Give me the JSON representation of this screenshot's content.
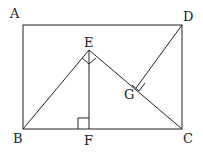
{
  "diagram": {
    "type": "geometry",
    "points": {
      "A": {
        "label": "A",
        "x": 23,
        "y": 25
      },
      "B": {
        "label": "B",
        "x": 23,
        "y": 129
      },
      "C": {
        "label": "C",
        "x": 182,
        "y": 129
      },
      "D": {
        "label": "D",
        "x": 182,
        "y": 25
      },
      "E": {
        "label": "E",
        "x": 89,
        "y": 50
      },
      "F": {
        "label": "F",
        "x": 89,
        "y": 129
      },
      "G": {
        "label": "G",
        "x": 136,
        "y": 88
      }
    },
    "segments": [
      "AB",
      "BC",
      "CD",
      "DA",
      "BE",
      "EC",
      "EF",
      "DG"
    ],
    "right_angles": [
      "BEC",
      "EFB",
      "DGC"
    ],
    "stroke_color": "#222222"
  }
}
